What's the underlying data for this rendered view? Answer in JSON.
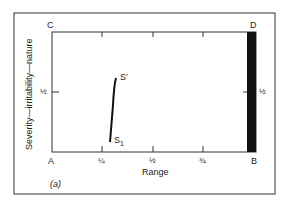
{
  "figure": {
    "panel_label": "(a)",
    "x_axis_label": "Range",
    "y_axis_label": "Severity—irritability—nature",
    "corners": {
      "top_left": "C",
      "top_right": "D",
      "bottom_left": "A",
      "bottom_right": "B"
    },
    "x_ticks": [
      "¼",
      "½",
      "¾"
    ],
    "y_tick_left": "½",
    "y_tick_right": "½",
    "curve": {
      "start_label": "S",
      "start_subscript": "1",
      "end_label": "S′"
    },
    "colors": {
      "ink": "#1a1a1a",
      "background": "#ffffff",
      "bar": "#111111"
    }
  }
}
